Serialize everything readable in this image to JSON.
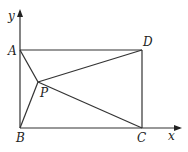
{
  "diagram": {
    "axes": {
      "x_label": "x",
      "y_label": "y"
    },
    "points": {
      "A": {
        "label": "A"
      },
      "B": {
        "label": "B"
      },
      "C": {
        "label": "C"
      },
      "D": {
        "label": "D"
      },
      "P": {
        "label": "P"
      }
    },
    "segments": [
      "AD",
      "DC",
      "AB",
      "BC",
      "PA",
      "PB",
      "PC",
      "PD"
    ]
  }
}
